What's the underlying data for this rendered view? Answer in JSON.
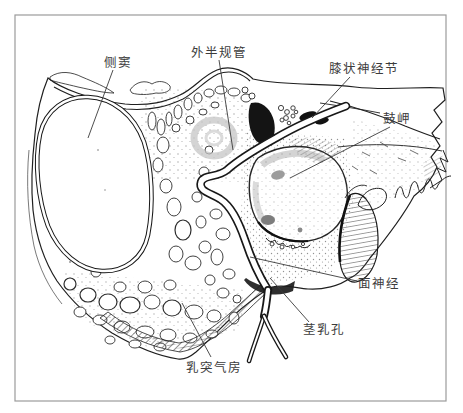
{
  "figure": {
    "type": "anatomical-line-drawing",
    "labels": {
      "lateral_sinus": "侧窦",
      "lateral_semicircular_canal": "外半规管",
      "geniculate_ganglion": "膝状神经节",
      "promontory": "鼓岬",
      "facial_nerve": "面神经",
      "stylomastoid_foramen": "茎乳孔",
      "mastoid_air_cells": "乳突气房"
    },
    "colors": {
      "ink": "#1f1f1f",
      "dark_fill": "#151515",
      "shade_gray": "#c6c6c6",
      "frame": "#9b9b9b",
      "background": "#ffffff",
      "label_text": "#3c3c3c"
    }
  }
}
